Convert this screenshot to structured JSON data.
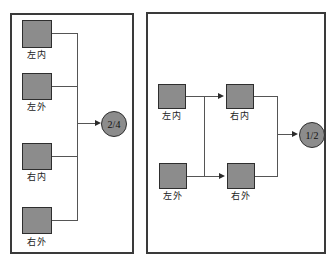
{
  "figure": {
    "background_color": "#ffffff",
    "box_fill_color": "#8c8c8c",
    "box_border_color": "#2e2e2e",
    "wire_color": "#555555",
    "panel_border_color": "#3a3a3a"
  },
  "panels": [
    {
      "id": "left",
      "nodes": [
        {
          "label": "左内"
        },
        {
          "label": "左外"
        },
        {
          "label": "右内"
        },
        {
          "label": "右外"
        }
      ],
      "output": {
        "label": "2/4"
      }
    },
    {
      "id": "right",
      "nodes": [
        {
          "label": "左内"
        },
        {
          "label": "右内"
        },
        {
          "label": "左外"
        },
        {
          "label": "右外"
        }
      ],
      "output": {
        "label": "1/2"
      }
    }
  ]
}
